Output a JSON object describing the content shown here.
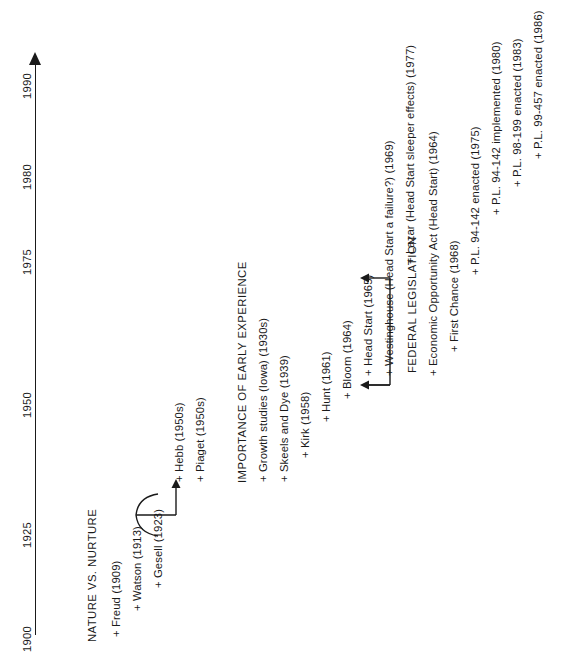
{
  "diagram": {
    "orientation": "vertical-rotated",
    "axis": {
      "name": "year-axis",
      "ticks": [
        {
          "label": "1900",
          "year": 1900
        },
        {
          "label": "1925",
          "year": 1925
        },
        {
          "label": "1950",
          "year": 1950
        },
        {
          "label": "1975",
          "year": 1975
        },
        {
          "label": "1980",
          "year": 1980
        },
        {
          "label": "1990",
          "year": 1990
        }
      ],
      "arrow": "right-arrowhead"
    },
    "sections": [
      {
        "id": "nature-vs-nurture",
        "label": "NATURE VS. NURTURE"
      },
      {
        "id": "importance-of-early-experience",
        "label": "IMPORTANCE OF EARLY EXPERIENCE"
      },
      {
        "id": "federal-legislation",
        "label": "FEDERAL LEGISLATION"
      }
    ],
    "events": [
      {
        "id": "freud",
        "label": "+ Freud (1909)"
      },
      {
        "id": "watson",
        "label": "+ Watson (1913)"
      },
      {
        "id": "gesell",
        "label": "+ Gesell (1923)"
      },
      {
        "id": "hebb",
        "label": "+ Hebb (1950s)"
      },
      {
        "id": "piaget",
        "label": "+ Piaget (1950s)"
      },
      {
        "id": "growth-studies",
        "label": "+ Growth studies (Iowa) (1930s)"
      },
      {
        "id": "skeels-and-dye",
        "label": "+ Skeels and Dye (1939)"
      },
      {
        "id": "kirk",
        "label": "+ Kirk (1958)"
      },
      {
        "id": "hunt",
        "label": "+ Hunt (1961)"
      },
      {
        "id": "bloom",
        "label": "+ Bloom (1964)"
      },
      {
        "id": "head-start",
        "label": "+ Head Start (1965)"
      },
      {
        "id": "westinghouse",
        "label": "+ Westinghouse (Head Start a failure?) (1969)"
      },
      {
        "id": "lazar",
        "label": "+ Lazar (Head Start sleeper effects) (1977)"
      },
      {
        "id": "economic-opportunity-act",
        "label": "+ Economic Opportunity Act (Head Start) (1964)"
      },
      {
        "id": "first-chance",
        "label": "+ First Chance (1968)"
      },
      {
        "id": "pl-94-142-enacted",
        "label": "+ P.L. 94-142 enacted (1975)"
      },
      {
        "id": "pl-94-142-implemented",
        "label": "+ P.L. 94-142 implemented (1980)"
      },
      {
        "id": "pl-98-199-enacted",
        "label": "+ P.L. 98-199 enacted (1983)"
      },
      {
        "id": "pl-99-457-enacted",
        "label": "+ P.L. 99-457 enacted (1986)"
      }
    ],
    "connectors": [
      {
        "id": "watson-gesell-to-hebb",
        "type": "brace-with-arrow"
      },
      {
        "id": "head-start-to-economic-opportunity-act",
        "type": "double-arrow-bracket"
      }
    ],
    "colors": {
      "ink": "#1a1a1a",
      "background": "#ffffff"
    }
  }
}
